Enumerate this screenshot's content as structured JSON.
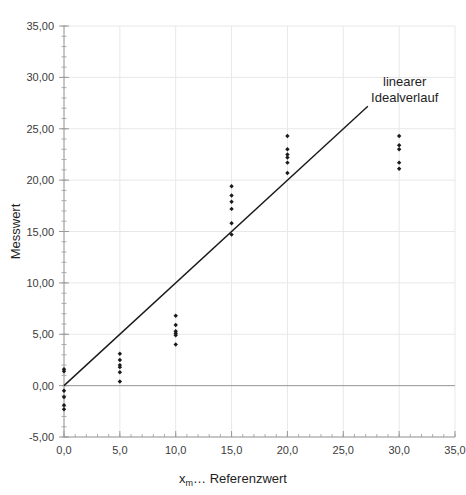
{
  "chart_data": {
    "type": "scatter",
    "title": "",
    "xlabel": "x_m ... Referenzwert",
    "xlabel_main": "x",
    "xlabel_sub": "m",
    "xlabel_rest": "… Referenzwert",
    "ylabel": "Messwert",
    "xlim": [
      0,
      35
    ],
    "ylim": [
      -5,
      35
    ],
    "grid": true,
    "legend_position": "inside-top-right",
    "x_ticks": [
      0,
      5,
      10,
      15,
      20,
      25,
      30,
      35
    ],
    "x_tick_labels": [
      "0,0",
      "5,0",
      "10,0",
      "15,0",
      "20,0",
      "25,0",
      "30,0",
      "35,0"
    ],
    "y_ticks": [
      -5,
      0,
      5,
      10,
      15,
      20,
      25,
      30,
      35
    ],
    "y_tick_labels": [
      "-5,00",
      "0,00",
      "5,00",
      "10,00",
      "15,00",
      "20,00",
      "25,00",
      "30,00",
      "35,00"
    ],
    "y_minor_step": 1,
    "series": [
      {
        "name": "Messwerte",
        "type": "scatter",
        "marker": "diamond",
        "color": "#1a1a1a",
        "points": [
          {
            "x": 0,
            "y": 1.6
          },
          {
            "x": 0,
            "y": 1.4
          },
          {
            "x": 0,
            "y": -0.5
          },
          {
            "x": 0,
            "y": -1.1
          },
          {
            "x": 0,
            "y": -1.9
          },
          {
            "x": 0,
            "y": -2.3
          },
          {
            "x": 5,
            "y": 3.1
          },
          {
            "x": 5,
            "y": 2.5
          },
          {
            "x": 5,
            "y": 2.0
          },
          {
            "x": 5,
            "y": 1.8
          },
          {
            "x": 5,
            "y": 1.3
          },
          {
            "x": 5,
            "y": 0.4
          },
          {
            "x": 10,
            "y": 6.8
          },
          {
            "x": 10,
            "y": 5.9
          },
          {
            "x": 10,
            "y": 5.3
          },
          {
            "x": 10,
            "y": 5.1
          },
          {
            "x": 10,
            "y": 4.9
          },
          {
            "x": 10,
            "y": 4.0
          },
          {
            "x": 15,
            "y": 19.4
          },
          {
            "x": 15,
            "y": 18.5
          },
          {
            "x": 15,
            "y": 17.9
          },
          {
            "x": 15,
            "y": 17.2
          },
          {
            "x": 15,
            "y": 15.8
          },
          {
            "x": 15,
            "y": 14.7
          },
          {
            "x": 20,
            "y": 24.3
          },
          {
            "x": 20,
            "y": 23.0
          },
          {
            "x": 20,
            "y": 22.5
          },
          {
            "x": 20,
            "y": 22.2
          },
          {
            "x": 20,
            "y": 21.7
          },
          {
            "x": 20,
            "y": 20.7
          },
          {
            "x": 30,
            "y": 24.3
          },
          {
            "x": 30,
            "y": 23.4
          },
          {
            "x": 30,
            "y": 23.0
          },
          {
            "x": 30,
            "y": 21.7
          },
          {
            "x": 30,
            "y": 21.1
          }
        ]
      },
      {
        "name": "linearer Idealverlauf",
        "type": "line",
        "color": "#1a1a1a",
        "slope": 1,
        "intercept": 0,
        "x_from": 0,
        "x_to": 27.2
      }
    ],
    "annotations": [
      {
        "text_line1": "linearer",
        "text_line2": "Idealverlauf",
        "x": 30.5,
        "y": 29.2
      }
    ]
  },
  "colors": {
    "marker": "#1a1a1a",
    "ideal_line": "#1a1a1a",
    "axis": "#9a9a9a",
    "gridline": "#e8e8e8",
    "tick_text": "#3b3b3b",
    "title_text": "#1e1e1e",
    "background": "#ffffff"
  },
  "annotation": {
    "line1": "linearer",
    "line2": "Idealverlauf"
  },
  "axes": {
    "y_title": "Messwert",
    "x_title_main": "x",
    "x_title_sub": "m",
    "x_title_rest": "… Referenzwert"
  }
}
